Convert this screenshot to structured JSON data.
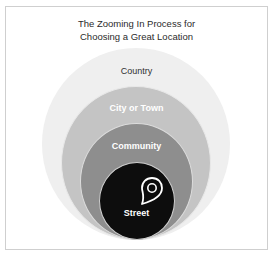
{
  "diagram": {
    "title_line1": "The Zooming In Process for",
    "title_line2": "Choosing a Great Location",
    "type": "nested-circles",
    "levels": [
      {
        "label": "Country",
        "color": "#efefef"
      },
      {
        "label": "City or Town",
        "color": "#c4c4c4"
      },
      {
        "label": "Community",
        "color": "#8e8e8e"
      },
      {
        "label": "Street",
        "color": "#0d0d0d",
        "icon": "map-pin-icon"
      }
    ]
  }
}
